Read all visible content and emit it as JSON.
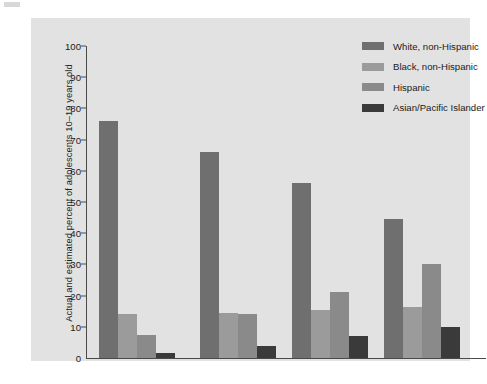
{
  "chart_data": {
    "type": "bar",
    "title": "",
    "subtitle": "",
    "xlabel": "",
    "ylabel": "Actual and estimated percent of adolescents 10–19 years old",
    "categories": [
      "1950",
      "2000",
      "2020",
      "2050"
    ],
    "ylim": [
      0,
      100
    ],
    "yticks": [
      0,
      10,
      20,
      30,
      40,
      50,
      60,
      70,
      80,
      90,
      100
    ],
    "grid": false,
    "legend_position": "top-right",
    "series": [
      {
        "name": "White, non-Hispanic",
        "color": "#6f6f6f",
        "values": [
          76,
          66,
          56,
          44.5
        ]
      },
      {
        "name": "Black, non-Hispanic",
        "color": "#9b9b9b",
        "values": [
          14,
          14.5,
          15.5,
          16.5
        ]
      },
      {
        "name": "Hispanic",
        "color": "#8a8a8a",
        "values": [
          7.5,
          14,
          21,
          30
        ]
      },
      {
        "name": "Asian/Pacific Islander",
        "color": "#3a3a3a",
        "values": [
          1.5,
          4,
          7,
          10
        ]
      }
    ]
  },
  "panel": {
    "background": "#e2e2e2",
    "axis_color": "#4a4a4a"
  }
}
